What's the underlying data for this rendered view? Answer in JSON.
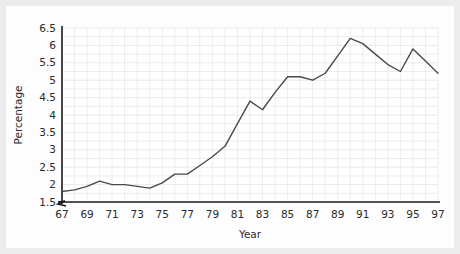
{
  "chart_data": {
    "type": "line",
    "title": "",
    "xlabel": "Year",
    "ylabel": "Percentage",
    "x": [
      67,
      68,
      69,
      70,
      71,
      72,
      73,
      74,
      75,
      76,
      77,
      78,
      79,
      80,
      81,
      82,
      83,
      84,
      85,
      86,
      87,
      88,
      89,
      90,
      91,
      92,
      93,
      94,
      95,
      96,
      97
    ],
    "values": [
      1.8,
      1.85,
      1.95,
      2.1,
      2.0,
      2.0,
      1.95,
      1.9,
      2.05,
      2.3,
      2.3,
      2.55,
      2.8,
      3.1,
      3.75,
      4.4,
      4.15,
      4.65,
      5.1,
      5.1,
      5.0,
      5.2,
      5.7,
      6.2,
      6.05,
      5.75,
      5.45,
      5.25,
      5.9,
      5.55,
      5.2
    ],
    "series": [
      {
        "name": "Percentage",
        "values": [
          1.8,
          1.85,
          1.95,
          2.1,
          2.0,
          2.0,
          1.95,
          1.9,
          2.05,
          2.3,
          2.3,
          2.55,
          2.8,
          3.1,
          3.75,
          4.4,
          4.15,
          4.65,
          5.1,
          5.1,
          5.0,
          5.2,
          5.7,
          6.2,
          6.05,
          5.75,
          5.45,
          5.25,
          5.9,
          5.55,
          5.2
        ],
        "color": "#4a4a4a"
      }
    ],
    "ylim": [
      1.5,
      6.5
    ],
    "xlim": [
      67,
      97
    ],
    "ytick_labels": [
      "6.5",
      "6",
      "5.5",
      "5",
      "4.5",
      "4",
      "3.5",
      "3",
      "2.5",
      "2",
      "1.5"
    ],
    "ytick_values": [
      6.5,
      6,
      5.5,
      5,
      4.5,
      4,
      3.5,
      3,
      2.5,
      2,
      1.5
    ],
    "xtick_labels": [
      "67",
      "69",
      "71",
      "73",
      "75",
      "77",
      "79",
      "81",
      "83",
      "85",
      "87",
      "89",
      "91",
      "93",
      "95",
      "97"
    ],
    "xtick_values": [
      67,
      69,
      71,
      73,
      75,
      77,
      79,
      81,
      83,
      85,
      87,
      89,
      91,
      93,
      95,
      97
    ],
    "grid": true,
    "legend": false,
    "axis_break": {
      "axis": "y",
      "below_value": 1.5,
      "symbol": "zigzag"
    },
    "line_color": "#4a4a4a",
    "axis_color": "#1c1c1c",
    "grid_color": "#e4e8ee",
    "background_color": "#fdfdfd",
    "frame_color": "#ececec"
  }
}
